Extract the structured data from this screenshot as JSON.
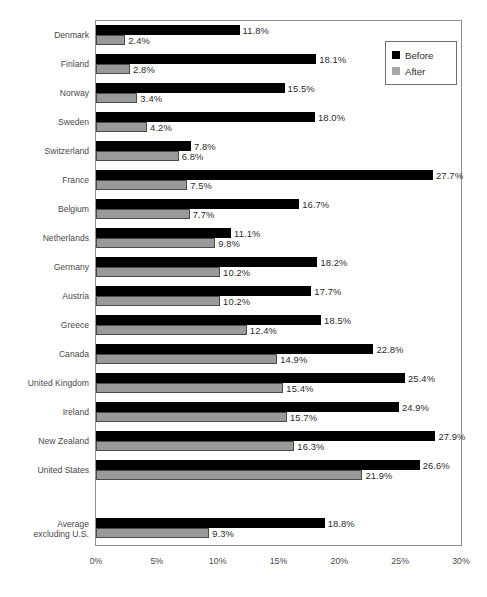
{
  "chart_data": {
    "type": "bar",
    "orientation": "horizontal",
    "title": "",
    "xlabel": "",
    "ylabel": "",
    "xlim": [
      0,
      30
    ],
    "xticks": [
      "0%",
      "5%",
      "10%",
      "15%",
      "20%",
      "25%",
      "30%"
    ],
    "xtick_values": [
      0,
      5,
      10,
      15,
      20,
      25,
      30
    ],
    "grid": false,
    "legend_position": "top-right",
    "categories": [
      "Denmark",
      "Finland",
      "Norway",
      "Sweden",
      "Switzerland",
      "France",
      "Belgium",
      "Netherlands",
      "Germany",
      "Austria",
      "Greece",
      "Canada",
      "United Kingdom",
      "Ireland",
      "New Zealand",
      "United States",
      "Average excluding U.S."
    ],
    "series": [
      {
        "name": "Before",
        "color": "#000000",
        "values": [
          11.8,
          18.1,
          15.5,
          18.0,
          7.8,
          27.7,
          16.7,
          11.1,
          18.2,
          17.7,
          18.5,
          22.8,
          25.4,
          24.9,
          27.9,
          26.6,
          18.8
        ],
        "labels": [
          "11.8%",
          "18.1%",
          "15.5%",
          "18.0%",
          "7.8%",
          "27.7%",
          "16.7%",
          "11.1%",
          "18.2%",
          "17.7%",
          "18.5%",
          "22.8%",
          "25.4%",
          "24.9%",
          "27.9%",
          "26.6%",
          "18.8%"
        ]
      },
      {
        "name": "After",
        "color": "#9a9a9a",
        "values": [
          2.4,
          2.8,
          3.4,
          4.2,
          6.8,
          7.5,
          7.7,
          9.8,
          10.2,
          10.2,
          12.4,
          14.9,
          15.4,
          15.7,
          16.3,
          21.9,
          9.3
        ],
        "labels": [
          "2.4%",
          "2.8%",
          "3.4%",
          "4.2%",
          "6.8%",
          "7.5%",
          "7.7%",
          "9.8%",
          "10.2%",
          "10.2%",
          "12.4%",
          "14.9%",
          "15.4%",
          "15.7%",
          "16.3%",
          "21.9%",
          "9.3%"
        ]
      }
    ]
  },
  "legend": {
    "items": [
      {
        "label": "Before",
        "color": "#000000"
      },
      {
        "label": "After",
        "color": "#a8a8a8"
      }
    ]
  }
}
